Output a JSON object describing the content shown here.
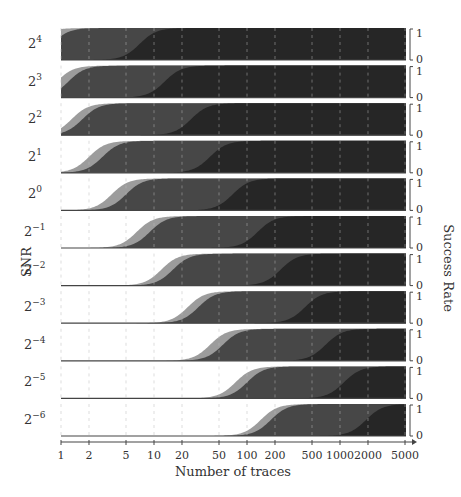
{
  "chart_data": {
    "type": "area",
    "title": "",
    "xlabel": "Number of traces",
    "ylabel_left": "SNR",
    "ylabel_right": "Success Rate",
    "xscale": "log",
    "xlim": [
      1,
      5000
    ],
    "x_ticks": [
      1,
      2,
      5,
      10,
      20,
      50,
      100,
      200,
      500,
      1000,
      2000,
      5000
    ],
    "x_tick_labels": [
      "1",
      "2",
      "5",
      "10",
      "20",
      "50",
      "100",
      "200",
      "500",
      "1000",
      "2000",
      "5000"
    ],
    "ylim": [
      0,
      1
    ],
    "row_y_ticks": [
      "0",
      "1"
    ],
    "grid": "vertical dashed at x ticks",
    "colors": {
      "light": "#9c9c9c",
      "mid": "#474747",
      "dark": "#262626"
    },
    "series_note": "Three stacked success-rate curves per SNR row (light, mid, dark); value = traces at 50% success",
    "rows": [
      {
        "snr": "2^4",
        "base": "2",
        "exp": "4",
        "light_mid": 0.5,
        "mid_mid": 0.8,
        "dark_mid": 7
      },
      {
        "snr": "2^3",
        "base": "2",
        "exp": "3",
        "light_mid": 0.9,
        "mid_mid": 1.2,
        "dark_mid": 13
      },
      {
        "snr": "2^2",
        "base": "2",
        "exp": "2",
        "light_mid": 1.3,
        "mid_mid": 1.7,
        "dark_mid": 25
      },
      {
        "snr": "2^1",
        "base": "2",
        "exp": "1",
        "light_mid": 2.0,
        "mid_mid": 2.8,
        "dark_mid": 40
      },
      {
        "snr": "2^0",
        "base": "2",
        "exp": "0",
        "light_mid": 3.5,
        "mid_mid": 5,
        "dark_mid": 70
      },
      {
        "snr": "2^-1",
        "base": "2",
        "exp": "−1",
        "light_mid": 6.5,
        "mid_mid": 9,
        "dark_mid": 130
      },
      {
        "snr": "2^-2",
        "base": "2",
        "exp": "−2",
        "light_mid": 12,
        "mid_mid": 16,
        "dark_mid": 230
      },
      {
        "snr": "2^-3",
        "base": "2",
        "exp": "−3",
        "light_mid": 23,
        "mid_mid": 30,
        "dark_mid": 420
      },
      {
        "snr": "2^-4",
        "base": "2",
        "exp": "−4",
        "light_mid": 40,
        "mid_mid": 55,
        "dark_mid": 700
      },
      {
        "snr": "2^-5",
        "base": "2",
        "exp": "−5",
        "light_mid": 75,
        "mid_mid": 100,
        "dark_mid": 1100
      },
      {
        "snr": "2^-6",
        "base": "2",
        "exp": "−6",
        "light_mid": 140,
        "mid_mid": 180,
        "dark_mid": 1900
      }
    ]
  }
}
